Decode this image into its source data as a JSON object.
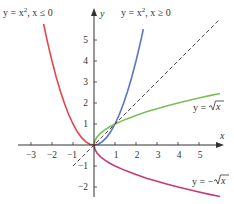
{
  "chart_data": {
    "type": "line",
    "title": "",
    "xlabel": "x",
    "ylabel": "y",
    "xlim": [
      -3.3,
      6.1
    ],
    "ylim": [
      -2.6,
      6.2
    ],
    "grid": false,
    "x_ticks": [
      -3,
      -2,
      -1,
      1,
      2,
      3,
      4,
      5
    ],
    "x_tick_labels": [
      "−3",
      "−2",
      "−1",
      "1",
      "2",
      "3",
      "4",
      "5"
    ],
    "y_ticks": [
      1,
      2,
      3,
      4,
      5,
      -1,
      -2
    ],
    "y_tick_labels": [
      "1",
      "2",
      "3",
      "4",
      "5",
      "−1",
      "−2"
    ],
    "series": [
      {
        "name": "y = x^2, x ≤ 0",
        "label": "y = x², x ≤ 0",
        "color": "#e0474c",
        "style": "solid",
        "x": [
          -2.4,
          -2.2,
          -2.0,
          -1.8,
          -1.6,
          -1.4,
          -1.2,
          -1.0,
          -0.8,
          -0.6,
          -0.4,
          -0.2,
          0
        ],
        "y": [
          5.76,
          4.84,
          4.0,
          3.24,
          2.56,
          1.96,
          1.44,
          1.0,
          0.64,
          0.36,
          0.16,
          0.04,
          0
        ]
      },
      {
        "name": "y = x^2, x ≥ 0",
        "label": "y = x², x ≥ 0",
        "color": "#5b74c8",
        "style": "solid",
        "x": [
          0,
          0.2,
          0.4,
          0.6,
          0.8,
          1.0,
          1.2,
          1.4,
          1.6,
          1.8,
          2.0,
          2.2,
          2.35
        ],
        "y": [
          0,
          0.04,
          0.16,
          0.36,
          0.64,
          1.0,
          1.44,
          1.96,
          2.56,
          3.24,
          4.0,
          4.84,
          5.52
        ]
      },
      {
        "name": "y = sqrt(x)",
        "label": "y = √x",
        "color": "#7cbf5a",
        "style": "solid",
        "x": [
          0,
          0.05,
          0.15,
          0.3,
          0.5,
          0.75,
          1.0,
          1.5,
          2.0,
          2.5,
          3.0,
          3.5,
          4.0,
          4.5,
          5.0,
          5.5,
          6.0
        ],
        "y": [
          0,
          0.22,
          0.39,
          0.55,
          0.71,
          0.87,
          1.0,
          1.22,
          1.41,
          1.58,
          1.73,
          1.87,
          2.0,
          2.12,
          2.24,
          2.35,
          2.45
        ]
      },
      {
        "name": "y = -sqrt(x)",
        "label": "y = −√x",
        "color": "#c43a7a",
        "style": "solid",
        "x": [
          0,
          0.05,
          0.15,
          0.3,
          0.5,
          0.75,
          1.0,
          1.5,
          2.0,
          2.5,
          3.0,
          3.5,
          4.0,
          4.5,
          5.0,
          5.5,
          6.0
        ],
        "y": [
          0,
          -0.22,
          -0.39,
          -0.55,
          -0.71,
          -0.87,
          -1.0,
          -1.22,
          -1.41,
          -1.58,
          -1.73,
          -1.87,
          -2.0,
          -2.12,
          -2.24,
          -2.35,
          -2.45
        ]
      },
      {
        "name": "y = x",
        "label": "",
        "color": "#333333",
        "style": "dashed",
        "x": [
          -1.0,
          6.0
        ],
        "y": [
          -1.0,
          6.0
        ]
      }
    ],
    "annotations": [
      {
        "text": "y = x², x ≤ 0",
        "target_series": 0,
        "position": "top-left"
      },
      {
        "text": "y = x², x ≥ 0",
        "target_series": 1,
        "position": "top-center"
      },
      {
        "text": "y = √x",
        "target_series": 2,
        "position": "right"
      },
      {
        "text": "y = −√x",
        "target_series": 3,
        "position": "bottom-right"
      }
    ]
  },
  "labels": {
    "left_parabola_prefix": "y = x",
    "left_parabola_exp": "2",
    "left_parabola_cond": ", x ≤ 0",
    "right_parabola_prefix": "y = x",
    "right_parabola_exp": "2",
    "right_parabola_cond": ", x ≥ 0",
    "sqrt_label_prefix": "y = ",
    "sqrt_label_radicand": "x",
    "neg_sqrt_label_prefix": "y = −",
    "neg_sqrt_label_radicand": "x",
    "x_axis": "x",
    "y_axis": "y"
  },
  "ticks": {
    "x": [
      "−3",
      "−2",
      "−1",
      "1",
      "2",
      "3",
      "4",
      "5"
    ],
    "y_pos": [
      "1",
      "2",
      "3",
      "4",
      "5"
    ],
    "y_neg": [
      "−1",
      "−2"
    ]
  }
}
